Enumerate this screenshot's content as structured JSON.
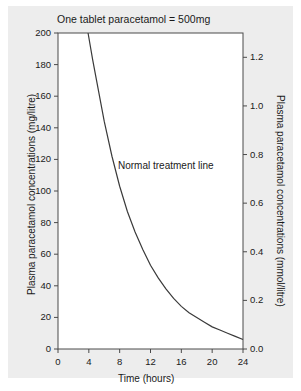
{
  "figure": {
    "background_color": "#ededed",
    "page_color": "#ffffff",
    "line_color": "#3a3a3a",
    "text_color": "#1a1a1a"
  },
  "chart_data": {
    "type": "line",
    "title": "One tablet paracetamol = 500mg",
    "xlabel": "Time (hours)",
    "ylabel": "Plasma paracetamol concentrations (mg/litre)",
    "ylabel_right": "Plasma paracetamol concentrations (mmol/litre)",
    "grid": false,
    "legend": false,
    "xlim": [
      0,
      24
    ],
    "ylim": [
      0,
      200
    ],
    "ylim_right": [
      0.0,
      1.3
    ],
    "xticks": [
      0,
      4,
      8,
      12,
      16,
      20,
      24
    ],
    "xtick_labels": [
      "0",
      "4",
      "8",
      "12",
      "16",
      "20",
      "24"
    ],
    "yticks": [
      0,
      20,
      40,
      60,
      80,
      100,
      120,
      140,
      160,
      180,
      200
    ],
    "ytick_labels": [
      "0",
      "20",
      "40",
      "60",
      "80",
      "100",
      "120",
      "140",
      "160",
      "180",
      "200"
    ],
    "yticks_right": [
      0.0,
      0.2,
      0.4,
      0.6,
      0.8,
      1.0,
      1.2
    ],
    "ytick_labels_right": [
      "0.0",
      "0.2",
      "0.4",
      "0.6",
      "0.8",
      "1.0",
      "1.2"
    ],
    "annotations": [
      {
        "text": "Normal treatment line",
        "x": 12.0,
        "y": 110
      }
    ],
    "series": [
      {
        "name": "Normal treatment line",
        "x": [
          3.9,
          4.5,
          5,
          6,
          7,
          8,
          9,
          10,
          11,
          12,
          13,
          14,
          15,
          16,
          17,
          18,
          19,
          20,
          21,
          22,
          23,
          24
        ],
        "values": [
          200,
          183,
          170,
          144,
          122,
          103,
          87,
          74,
          63,
          53,
          45,
          38,
          32,
          27,
          23,
          20,
          17,
          14,
          12,
          10,
          8,
          6
        ]
      }
    ]
  }
}
